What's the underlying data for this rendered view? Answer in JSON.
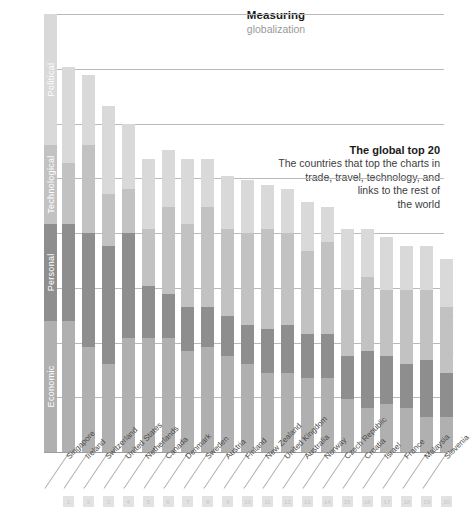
{
  "title": {
    "line1": "Measuring",
    "line2": "globalization"
  },
  "callout": {
    "heading": "The global top 20",
    "line1": "The countries that top the charts in",
    "line2": "trade, travel, technology, and",
    "line3": "links to the rest of",
    "line4": "the world"
  },
  "credit": "ChristianSarkar.com",
  "colors": {
    "political": "#d9d9d9",
    "technological": "#c2c2c2",
    "personal": "#8e8e8e",
    "economic": "#b0b0b0",
    "gridline": "#b9b9b9",
    "label": "#4a4a4a",
    "title": "#1a1a1a",
    "subtitle": "#9a9a9a"
  },
  "chart_data": {
    "type": "bar",
    "title": "Measuring globalization",
    "subtitle": "The global top 20",
    "xlabel": "",
    "ylabel": "",
    "grid": true,
    "stacked": true,
    "legend_position": "left-vertical-axis",
    "legend": [
      "Political",
      "Technological",
      "Personal",
      "Economic"
    ],
    "ylim": [
      0,
      100
    ],
    "yticks": [
      0,
      12.5,
      25,
      37.5,
      50,
      62.5,
      75,
      87.5,
      100
    ],
    "categories": [
      "Singapore",
      "Ireland",
      "Switzerland",
      "United States",
      "Netherlands",
      "Canada",
      "Denmark",
      "Sweden",
      "Austria",
      "Finland",
      "New Zealand",
      "United Kingdom",
      "Australia",
      "Norway",
      "Czech Republic",
      "Croatia",
      "Israel",
      "France",
      "Malaysia",
      "Slovenia"
    ],
    "ranks": [
      1,
      2,
      3,
      4,
      5,
      6,
      7,
      8,
      9,
      10,
      11,
      12,
      13,
      14,
      15,
      16,
      17,
      18,
      19,
      20
    ],
    "series": [
      {
        "name": "Political",
        "color": "#d9d9d9",
        "values": [
          22,
          16,
          20,
          15,
          16,
          13,
          15,
          11,
          12,
          12,
          10,
          10,
          11,
          8,
          14,
          11,
          12,
          10,
          10,
          11
        ]
      },
      {
        "name": "Technological",
        "color": "#c2c2c2",
        "values": [
          14,
          20,
          12,
          10,
          13,
          20,
          19,
          23,
          20,
          21,
          23,
          21,
          19,
          21,
          15,
          17,
          15,
          17,
          16,
          15
        ]
      },
      {
        "name": "Personal",
        "color": "#8e8e8e",
        "values": [
          22,
          26,
          27,
          24,
          12,
          10,
          10,
          9,
          9,
          9,
          10,
          11,
          10,
          10,
          10,
          13,
          11,
          10,
          13,
          10
        ]
      },
      {
        "name": "Economic",
        "color": "#b0b0b0",
        "values": [
          30,
          24,
          20,
          26,
          26,
          26,
          23,
          24,
          22,
          20,
          18,
          18,
          17,
          17,
          12,
          10,
          11,
          10,
          8,
          8
        ]
      }
    ],
    "totals": [
      88,
      86,
      79,
      75,
      67,
      69,
      67,
      67,
      63,
      62,
      61,
      60,
      57,
      56,
      51,
      51,
      49,
      47,
      47,
      44
    ]
  }
}
